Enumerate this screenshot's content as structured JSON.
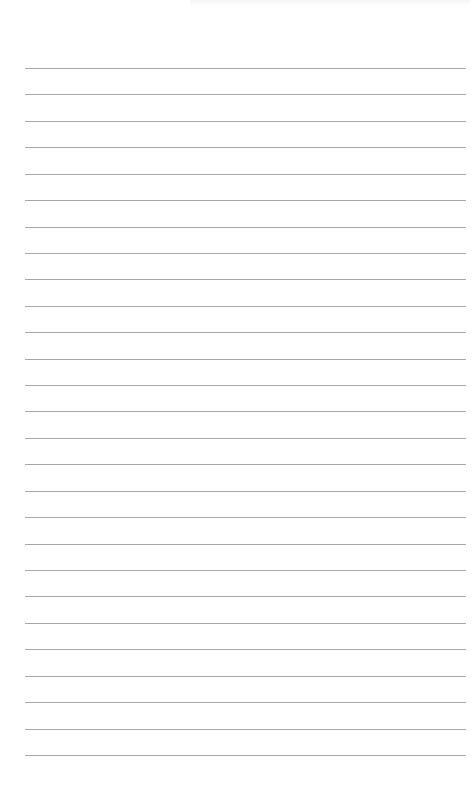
{
  "page": {
    "type": "lined-paper",
    "background_color": "#ffffff",
    "rule_color": "#a9a9a9",
    "rule_count": 27,
    "first_rule_y": 68,
    "rule_spacing": 26.42,
    "rule_left": 25,
    "rule_width": 441
  }
}
